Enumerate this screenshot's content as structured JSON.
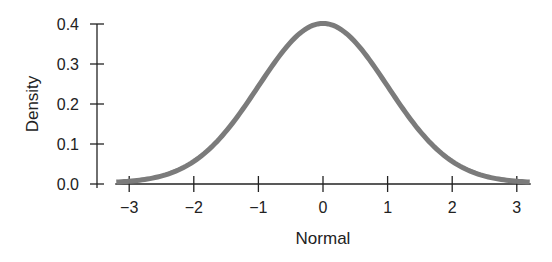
{
  "chart_data": {
    "type": "line",
    "title": "",
    "xlabel": "Normal",
    "ylabel": "Density",
    "x_ticks": [
      -3,
      -2,
      -1,
      0,
      1,
      2,
      3
    ],
    "x_tick_labels": [
      "−3",
      "−2",
      "−1",
      "0",
      "1",
      "2",
      "3"
    ],
    "y_ticks": [
      0.0,
      0.1,
      0.2,
      0.3,
      0.4
    ],
    "y_tick_labels": [
      "0.0",
      "0.1",
      "0.2",
      "0.3",
      "0.4"
    ],
    "xlim": [
      -3.2,
      3.2
    ],
    "ylim": [
      0,
      0.4
    ],
    "grid": false,
    "legend": null,
    "series": [
      {
        "name": "Standard normal density",
        "color": "#7b7b7b",
        "x": [
          -3.2,
          -3.0,
          -2.5,
          -2.0,
          -1.5,
          -1.0,
          -0.5,
          0.0,
          0.5,
          1.0,
          1.5,
          2.0,
          2.5,
          3.0,
          3.2
        ],
        "y": [
          0.0024,
          0.0044,
          0.0175,
          0.054,
          0.1295,
          0.242,
          0.3521,
          0.3989,
          0.3521,
          0.242,
          0.1295,
          0.054,
          0.0175,
          0.0044,
          0.0024
        ]
      }
    ]
  }
}
